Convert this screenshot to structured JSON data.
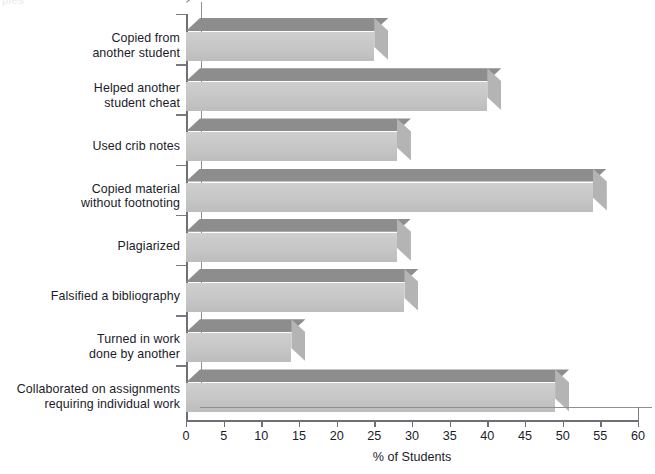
{
  "figure": {
    "ghost_text": "ples",
    "bar_color_front": "#c6c6c6",
    "bar_color_top": "#8d8d8d",
    "bar_color_side": "#b4b4b4",
    "axis_color": "#6f6f78",
    "text_color": "#1b1b2a"
  },
  "chart_data": {
    "type": "bar",
    "orientation": "horizontal",
    "title": "",
    "subtitle": "",
    "xlabel": "% of Students",
    "ylabel": "",
    "xlim": [
      0,
      60
    ],
    "xticks": [
      0,
      5,
      10,
      15,
      20,
      25,
      30,
      35,
      40,
      45,
      50,
      55,
      60
    ],
    "xtick_labels": [
      "0",
      "5",
      "10",
      "15",
      "20",
      "25",
      "30",
      "35",
      "40",
      "45",
      "50",
      "55",
      "60"
    ],
    "grid": false,
    "legend": null,
    "categories": [
      "Copied from another student",
      "Helped another student cheat",
      "Used crib notes",
      "Copied material without footnoting",
      "Plagiarized",
      "Falsified a bibliography",
      "Turned in work done by another",
      "Collaborated on assignments requiring individual work"
    ],
    "category_lines": [
      [
        "Copied from",
        "another student"
      ],
      [
        "Helped another",
        "student cheat"
      ],
      [
        "Used crib notes"
      ],
      [
        "Copied material",
        "without footnoting"
      ],
      [
        "Plagiarized"
      ],
      [
        "Falsified a bibliography"
      ],
      [
        "Turned in work",
        "done by another"
      ],
      [
        "Collaborated on assignments",
        "requiring individual work"
      ]
    ],
    "values": [
      25,
      40,
      28,
      54,
      28,
      29,
      14,
      49
    ]
  }
}
